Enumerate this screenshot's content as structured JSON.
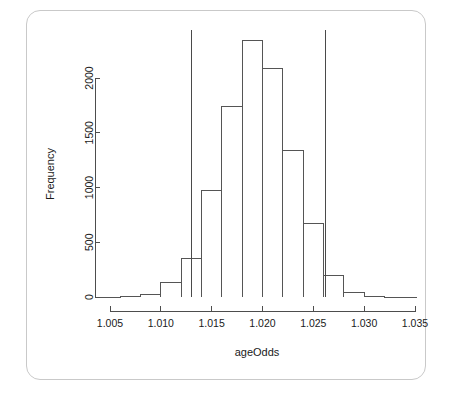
{
  "figure": {
    "card_name": "histogram-card",
    "background_color": "#ffffff",
    "border_color": "#c9c9c9",
    "axis_color": "#4d4d4d",
    "bar_stroke_color": "#555555",
    "vline_color": "#4a4a4a"
  },
  "chart_data": {
    "type": "bar",
    "subtype": "histogram",
    "title": "",
    "xlabel": "ageOdds",
    "ylabel": "Frequency",
    "xlim": [
      1.0042,
      1.0352
    ],
    "ylim": [
      0,
      2400
    ],
    "xticks": [
      1.005,
      1.01,
      1.015,
      1.02,
      1.025,
      1.03,
      1.035
    ],
    "xtick_labels": [
      "1.005",
      "1.010",
      "1.015",
      "1.020",
      "1.025",
      "1.030",
      "1.035"
    ],
    "yticks": [
      0,
      500,
      1000,
      1500,
      2000
    ],
    "ytick_labels": [
      "0",
      "500",
      "1000",
      "1500",
      "2000"
    ],
    "grid": false,
    "legend": false,
    "bin_width": 0.002,
    "bin_edges": [
      1.004,
      1.006,
      1.008,
      1.01,
      1.012,
      1.014,
      1.016,
      1.018,
      1.02,
      1.022,
      1.024,
      1.026,
      1.028,
      1.03,
      1.032,
      1.034
    ],
    "bin_centers": [
      1.005,
      1.007,
      1.009,
      1.011,
      1.013,
      1.015,
      1.017,
      1.019,
      1.021,
      1.023,
      1.025,
      1.027,
      1.029,
      1.031,
      1.033
    ],
    "values": [
      0,
      2,
      20,
      130,
      350,
      970,
      1740,
      2340,
      2090,
      1340,
      670,
      200,
      45,
      4,
      0
    ],
    "annotations": [
      {
        "name": "lower-reference-line",
        "type": "vertical-line",
        "x": 1.013,
        "label": ""
      },
      {
        "name": "upper-reference-line",
        "type": "vertical-line",
        "x": 1.0262,
        "label": ""
      }
    ]
  }
}
